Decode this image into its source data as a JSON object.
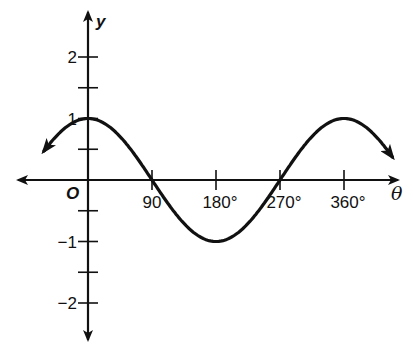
{
  "chart_data": {
    "type": "line",
    "title": "",
    "function": "y = cos θ",
    "xlabel": "θ",
    "ylabel": "y",
    "origin_label": "O",
    "x_ticks": [
      90,
      180,
      270,
      360
    ],
    "x_tick_labels": [
      "90",
      "180°",
      "270°",
      "360°"
    ],
    "y_ticks": [
      -2,
      -1,
      1,
      2
    ],
    "y_tick_labels": [
      "−2",
      "−1",
      "1",
      "2"
    ],
    "y_minor_ticks": [
      -1.5,
      -0.5,
      0.5,
      1.5
    ],
    "xlim": [
      -62,
      428
    ],
    "ylim": [
      -2.6,
      2.5
    ],
    "grid": false,
    "legend": null,
    "series": [
      {
        "name": "cos θ",
        "x": [
          -60,
          0,
          90,
          180,
          270,
          360,
          420
        ],
        "y": [
          0.5,
          1,
          0,
          -1,
          0,
          1,
          0.5
        ],
        "arrows_both_ends": true
      }
    ],
    "key_points": [
      {
        "x": 0,
        "y": 1,
        "label": "maximum"
      },
      {
        "x": 90,
        "y": 0,
        "label": "zero"
      },
      {
        "x": 180,
        "y": -1,
        "label": "minimum"
      },
      {
        "x": 270,
        "y": 0,
        "label": "zero"
      },
      {
        "x": 360,
        "y": 1,
        "label": "maximum"
      }
    ]
  },
  "style": {
    "line_color": "#111111",
    "axis_color": "#111111",
    "background": "#ffffff"
  }
}
